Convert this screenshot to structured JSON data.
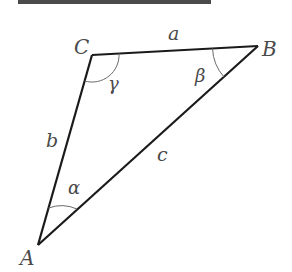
{
  "diagram": {
    "type": "triangle",
    "colors": {
      "edge": "#1a1a1a",
      "arc": "#6a6a6a",
      "label": "#4a4a4a",
      "header_bar": "#4a4a4a"
    },
    "vertices": [
      {
        "id": "A",
        "label": "A",
        "x": 38,
        "y": 245
      },
      {
        "id": "B",
        "label": "B",
        "x": 258,
        "y": 46
      },
      {
        "id": "C",
        "label": "C",
        "x": 92,
        "y": 55
      }
    ],
    "sides": [
      {
        "id": "a",
        "label": "a",
        "between": [
          "B",
          "C"
        ]
      },
      {
        "id": "b",
        "label": "b",
        "between": [
          "A",
          "C"
        ]
      },
      {
        "id": "c",
        "label": "c",
        "between": [
          "A",
          "B"
        ]
      }
    ],
    "angles": [
      {
        "id": "alpha",
        "label": "α",
        "vertex": "A"
      },
      {
        "id": "beta",
        "label": "β",
        "vertex": "B"
      },
      {
        "id": "gamma",
        "label": "γ",
        "vertex": "C"
      }
    ]
  }
}
